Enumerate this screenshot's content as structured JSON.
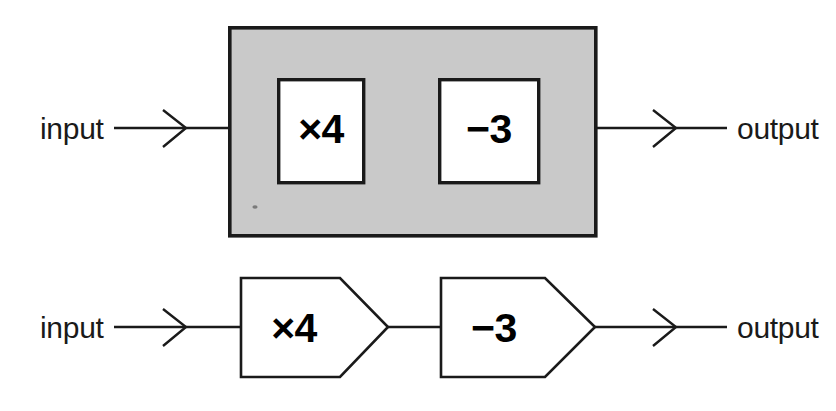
{
  "figure": {
    "background_color": "#ffffff",
    "line_color": "#1a1a1a",
    "gray_fill": "#c9c9c9",
    "white_fill": "#ffffff"
  },
  "diagrams": [
    {
      "id": "boxed-machine",
      "style": "gray-container-with-square-boxes",
      "input_label": "input",
      "output_label": "output",
      "operations": [
        {
          "label": "×4",
          "operator": "×",
          "operand": 4
        },
        {
          "label": "−3",
          "operator": "−",
          "operand": 3
        }
      ]
    },
    {
      "id": "chained-machine",
      "style": "pentagon-arrow-boxes-in-series",
      "input_label": "input",
      "output_label": "output",
      "operations": [
        {
          "label": "×4",
          "operator": "×",
          "operand": 4
        },
        {
          "label": "−3",
          "operator": "−",
          "operand": 3
        }
      ]
    }
  ],
  "icons": {
    "arrowhead": "chevron-right-icon",
    "wire": "connector-line"
  }
}
